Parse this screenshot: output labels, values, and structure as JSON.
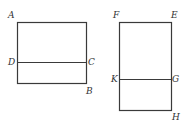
{
  "diagram": {
    "figures": [
      {
        "name": "rectangle-ABCD",
        "rect": {
          "x": 17,
          "y": 22,
          "w": 69,
          "h": 61
        },
        "divider_y": 62,
        "labels": {
          "A": "A",
          "B": "B",
          "C": "C",
          "D": "D"
        }
      },
      {
        "name": "rectangle-FEHK",
        "rect": {
          "x": 119,
          "y": 22,
          "w": 52,
          "h": 88
        },
        "divider_y": 79,
        "labels": {
          "F": "F",
          "E": "E",
          "G": "G",
          "H": "H",
          "K": "K"
        }
      }
    ],
    "stroke_color": "#3a3a3a",
    "label_color": "#333333"
  }
}
